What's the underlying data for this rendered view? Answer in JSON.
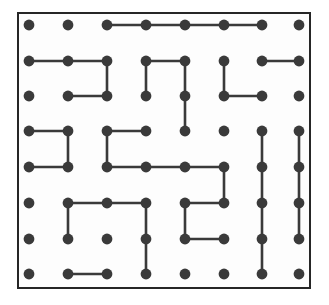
{
  "figure": {
    "kind": "grid-dot-diagram"
  },
  "canvas": {
    "width": 329,
    "height": 305,
    "background": "#ffffff"
  },
  "frame": {
    "x": 17,
    "y": 12,
    "width": 294,
    "height": 277,
    "border_color": "#262626",
    "border_width": 2,
    "fill": "#fdfdfd"
  },
  "grid": {
    "rows": 8,
    "cols": 8,
    "col_x": [
      29,
      68,
      107,
      146,
      185,
      224,
      262,
      299
    ],
    "row_y": [
      25,
      61,
      96,
      131,
      167,
      203,
      239,
      274
    ],
    "dot_radius": 5.4,
    "dot_color": "#3a3a3a",
    "edge_color": "#3a3a3a",
    "edge_width": 2.6
  },
  "edges": {
    "horizontal": [
      {
        "row": 0,
        "from_col": 2,
        "to_col": 3
      },
      {
        "row": 0,
        "from_col": 3,
        "to_col": 4
      },
      {
        "row": 0,
        "from_col": 4,
        "to_col": 5
      },
      {
        "row": 0,
        "from_col": 5,
        "to_col": 6
      },
      {
        "row": 1,
        "from_col": 0,
        "to_col": 1
      },
      {
        "row": 1,
        "from_col": 1,
        "to_col": 2
      },
      {
        "row": 1,
        "from_col": 3,
        "to_col": 4
      },
      {
        "row": 1,
        "from_col": 6,
        "to_col": 7
      },
      {
        "row": 2,
        "from_col": 1,
        "to_col": 2
      },
      {
        "row": 2,
        "from_col": 5,
        "to_col": 6
      },
      {
        "row": 3,
        "from_col": 0,
        "to_col": 1
      },
      {
        "row": 3,
        "from_col": 2,
        "to_col": 3
      },
      {
        "row": 4,
        "from_col": 0,
        "to_col": 1
      },
      {
        "row": 4,
        "from_col": 2,
        "to_col": 3
      },
      {
        "row": 4,
        "from_col": 3,
        "to_col": 4
      },
      {
        "row": 4,
        "from_col": 4,
        "to_col": 5
      },
      {
        "row": 5,
        "from_col": 1,
        "to_col": 2
      },
      {
        "row": 5,
        "from_col": 2,
        "to_col": 3
      },
      {
        "row": 5,
        "from_col": 4,
        "to_col": 5
      },
      {
        "row": 6,
        "from_col": 4,
        "to_col": 5
      },
      {
        "row": 7,
        "from_col": 1,
        "to_col": 2
      }
    ],
    "vertical": [
      {
        "col": 2,
        "from_row": 1,
        "to_row": 2
      },
      {
        "col": 3,
        "from_row": 1,
        "to_row": 2
      },
      {
        "col": 4,
        "from_row": 1,
        "to_row": 2
      },
      {
        "col": 4,
        "from_row": 2,
        "to_row": 3
      },
      {
        "col": 5,
        "from_row": 1,
        "to_row": 2
      },
      {
        "col": 1,
        "from_row": 3,
        "to_row": 4
      },
      {
        "col": 2,
        "from_row": 3,
        "to_row": 4
      },
      {
        "col": 6,
        "from_row": 3,
        "to_row": 4
      },
      {
        "col": 6,
        "from_row": 4,
        "to_row": 5
      },
      {
        "col": 6,
        "from_row": 5,
        "to_row": 6
      },
      {
        "col": 6,
        "from_row": 6,
        "to_row": 7
      },
      {
        "col": 7,
        "from_row": 3,
        "to_row": 4
      },
      {
        "col": 7,
        "from_row": 4,
        "to_row": 5
      },
      {
        "col": 7,
        "from_row": 5,
        "to_row": 6
      },
      {
        "col": 5,
        "from_row": 4,
        "to_row": 5
      },
      {
        "col": 1,
        "from_row": 5,
        "to_row": 6
      },
      {
        "col": 3,
        "from_row": 5,
        "to_row": 6
      },
      {
        "col": 3,
        "from_row": 6,
        "to_row": 7
      },
      {
        "col": 4,
        "from_row": 5,
        "to_row": 6
      }
    ]
  }
}
